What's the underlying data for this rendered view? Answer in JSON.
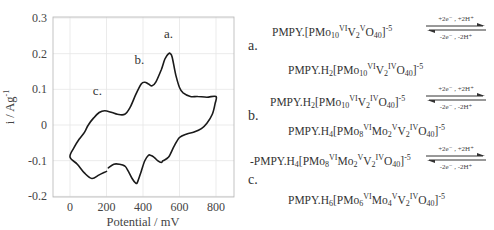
{
  "chart_data": {
    "type": "line",
    "title": "",
    "xlabel": "Potential / mV",
    "ylabel": "i / Ag⁻¹",
    "xlim": [
      -100,
      900
    ],
    "ylim": [
      -0.2,
      0.3
    ],
    "xticks": [
      0,
      200,
      400,
      600,
      800
    ],
    "yticks": [
      0.3,
      0.2,
      0.1,
      0,
      -0.1,
      -0.2
    ],
    "xtick_labels": [
      "0",
      "200",
      "400",
      "600",
      "800"
    ],
    "ytick_labels": [
      "0.3",
      "0.2",
      "0.1",
      "0",
      "-0.1",
      "-0.2"
    ],
    "grid": true,
    "legend": null,
    "series": [
      {
        "name": "Cyclic voltammogram",
        "x": [
          200,
          160,
          120,
          80,
          40,
          0,
          20,
          50,
          80,
          100,
          130,
          160,
          190,
          230,
          260,
          300,
          330,
          360,
          390,
          410,
          430,
          450,
          470,
          500,
          520,
          540,
          550,
          560,
          580,
          600,
          620,
          660,
          700,
          750,
          800,
          795,
          780,
          750,
          720,
          680,
          640,
          600,
          570,
          540,
          510,
          500,
          480,
          460,
          440,
          430,
          410,
          390,
          370,
          360,
          340,
          320,
          300,
          270,
          240,
          210
        ],
        "y": [
          -0.13,
          -0.14,
          -0.15,
          -0.135,
          -0.11,
          -0.09,
          -0.065,
          -0.04,
          -0.02,
          0.0,
          0.02,
          0.035,
          0.04,
          0.035,
          0.03,
          0.03,
          0.05,
          0.085,
          0.115,
          0.12,
          0.115,
          0.11,
          0.12,
          0.155,
          0.185,
          0.2,
          0.2,
          0.19,
          0.14,
          0.105,
          0.09,
          0.08,
          0.08,
          0.078,
          0.08,
          0.06,
          0.03,
          0.005,
          -0.01,
          -0.02,
          -0.025,
          -0.035,
          -0.06,
          -0.09,
          -0.1,
          -0.105,
          -0.1,
          -0.09,
          -0.085,
          -0.085,
          -0.1,
          -0.13,
          -0.16,
          -0.163,
          -0.15,
          -0.13,
          -0.115,
          -0.11,
          -0.11,
          -0.12
        ]
      }
    ],
    "annotations": [
      {
        "text": "a.",
        "x": 540,
        "y": 0.245
      },
      {
        "text": "b.",
        "x": 380,
        "y": 0.17
      },
      {
        "text": "c.",
        "x": 150,
        "y": 0.085
      }
    ]
  },
  "reactions": [
    {
      "letter": "a.",
      "reactant": "PMPY.[PMo<sub>10</sub><sup>VI</sup>V<sub>2</sub><sup>V</sup>O<sub>40</sub>]<sup>-5</sup>",
      "product": "PMPY.H<sub>2</sub>[PMo<sub>10</sub><sup>VI</sup>V<sub>2</sub><sup>IV</sup>O<sub>40</sub>]<sup>-5</sup>",
      "forward": "+2e⁻ , +2H⁺",
      "reverse": "-2e⁻ , -2H⁺"
    },
    {
      "letter": "b.",
      "reactant": "PMPY.H<sub>2</sub>[PMo<sub>10</sub><sup>VI</sup>V<sub>2</sub><sup>IV</sup>O<sub>40</sub>]<sup>-5</sup>",
      "product": "PMPY.H<sub>4</sub>[PMo<sub>8</sub><sup>VI</sup>Mo<sub>2</sub><sup>V</sup>V<sub>2</sub><sup>IV</sup>O<sub>40</sub>]<sup>-5</sup>",
      "forward": "+2e⁻ , +2H⁺",
      "reverse": "-2e⁻ , -2H⁺"
    },
    {
      "letter": "c.",
      "reactant": "-PMPY.H<sub>4</sub>[PMo<sub>8</sub><sup>VI</sup>Mo<sub>2</sub><sup>V</sup>V<sub>2</sub><sup>IV</sup>O<sub>40</sub>]<sup>-5</sup>",
      "product": "PMPY.H<sub>6</sub>[PMo<sub>6</sub><sup>VI</sup>Mo<sub>4</sub><sup>V</sup>V<sub>2</sub><sup>IV</sup>O<sub>40</sub>]<sup>-5</sup>",
      "forward": "+2e⁻ , +2H⁺",
      "reverse": "-2e⁻ , -2H⁺"
    }
  ],
  "colors": {
    "curve": "#1a1a1a",
    "grid": "#e6e6e6",
    "frame": "#b5b5b5",
    "text": "#444444"
  }
}
